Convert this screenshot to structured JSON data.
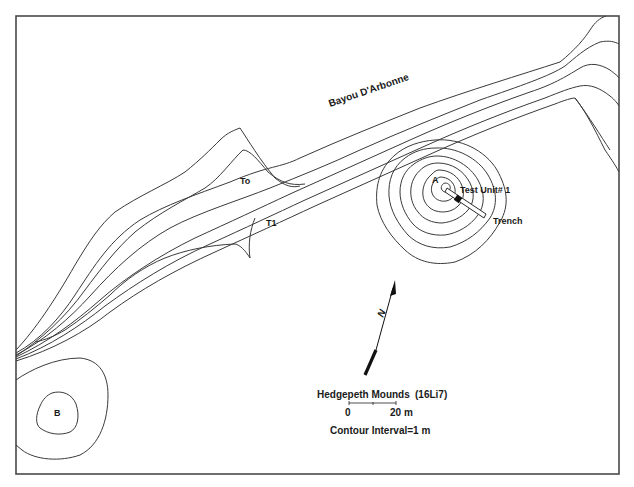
{
  "map": {
    "site_name": "Hedgepeth Mounds",
    "site_code": "(16Li7)",
    "river_label": "Bayou D'Arbonne",
    "terrace_labels": {
      "t0": "To",
      "t1": "T1"
    },
    "mound_labels": {
      "a": "A",
      "b": "B"
    },
    "feature_labels": {
      "test_unit": "Test Unit# 1",
      "trench": "Trench"
    },
    "north_arrow_label": "N",
    "scale": {
      "start_label": "0",
      "end_label": "20 m"
    },
    "contour_interval": "Contour Interval=1 m",
    "colors": {
      "line": "#3a3a3a",
      "frame": "#4a4a4a",
      "text": "#1a1a1a",
      "background": "#ffffff"
    }
  }
}
